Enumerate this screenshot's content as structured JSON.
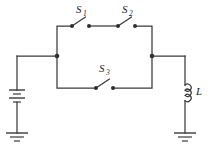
{
  "figure": {
    "type": "circuit-schematic",
    "background_color": "#ffffff",
    "line_color": "#3a3a3a",
    "width": 211,
    "height": 149
  },
  "components": {
    "switch_1": {
      "label": "S",
      "subscript": "1",
      "state": "open",
      "position": "top-left-branch"
    },
    "switch_2": {
      "label": "S",
      "subscript": "2",
      "state": "open",
      "position": "top-right-branch"
    },
    "switch_3": {
      "label": "S",
      "subscript": "3",
      "state": "open",
      "position": "middle-branch"
    },
    "inductor": {
      "label": "L",
      "subscript": "",
      "position": "right-branch"
    },
    "battery": {
      "label": "",
      "cells": 2,
      "position": "left-branch"
    },
    "ground_left": {
      "label": "",
      "position": "bottom-left"
    },
    "ground_right": {
      "label": "",
      "position": "bottom-right"
    }
  }
}
